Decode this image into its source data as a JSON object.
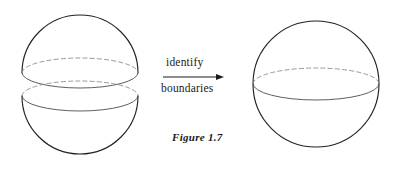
{
  "figure": {
    "caption": "Figure 1.7",
    "transformation_label_top": "identify",
    "transformation_label_bottom": "boundaries",
    "background_color": "#ffffff",
    "outline_color": "#222222",
    "hidden_edge_color": "#888888",
    "visible_edge_color": "#555555",
    "left_diagram": {
      "name": "two-hemispheres",
      "upper_hemisphere": {
        "label": "upper-hemisphere",
        "center_x": 80,
        "center_y": 73,
        "radius_x": 58,
        "radius_y": 58,
        "rim_ellipse_ry": 15
      },
      "lower_hemisphere": {
        "label": "lower-hemisphere",
        "center_x": 80,
        "center_y": 96,
        "radius_x": 58,
        "radius_y": 58,
        "rim_ellipse_ry": 15
      }
    },
    "right_diagram": {
      "name": "sphere",
      "label": "identified-sphere",
      "center_x": 316,
      "center_y": 84,
      "radius": 63,
      "equator_ellipse_ry": 16
    },
    "arrow": {
      "label": "identify-boundaries-arrow",
      "x_start": 163,
      "x_end": 224,
      "y": 77
    }
  }
}
